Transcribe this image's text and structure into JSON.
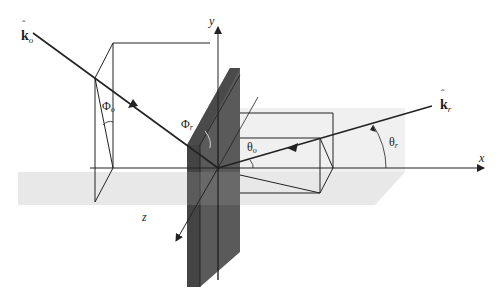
{
  "diagram": {
    "type": "3D scattering geometry",
    "colors": {
      "line": "#222222",
      "plate_front": "#4a4a4a",
      "plate_side": "#5c5c5c",
      "plane_shade": "#e6e6e6",
      "plane_shade_dark": "#d2d2d2"
    },
    "axes": {
      "x": "x",
      "y": "y",
      "z": "z"
    },
    "vectors": {
      "incident": {
        "symbol": "k",
        "subscript": "o",
        "hat": "ˆ"
      },
      "scattered": {
        "symbol": "k",
        "subscript": "r",
        "hat": "ˆ"
      }
    },
    "angles": {
      "phi_o": {
        "symbol": "Φ",
        "subscript": "o"
      },
      "phi_r": {
        "symbol": "Φ",
        "subscript": "r"
      },
      "theta_o": {
        "symbol": "θ",
        "subscript": "o"
      },
      "theta_r": {
        "symbol": "θ",
        "subscript": "r"
      }
    }
  }
}
